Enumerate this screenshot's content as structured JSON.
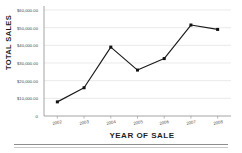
{
  "chart_data": {
    "type": "line",
    "title": "",
    "xlabel": "YEAR OF SALE",
    "ylabel": "TOTAL SALES",
    "categories": [
      "2002",
      "2003",
      "2004",
      "2005",
      "2006",
      "2007",
      "2008"
    ],
    "values": [
      8000,
      16000,
      39000,
      26000,
      32500,
      51500,
      49000
    ],
    "series": [
      {
        "name": "Total Sales",
        "values": [
          8000,
          16000,
          39000,
          26000,
          32500,
          51500,
          49000
        ]
      }
    ],
    "ylim": [
      0,
      60000
    ],
    "ytick_labels": [
      "$60,000.00",
      "$50,000.00",
      "$40,000.00",
      "$30,000.00",
      "$20,000.00",
      "$10,000.00"
    ],
    "ytick_values": [
      60000,
      50000,
      40000,
      30000,
      20000,
      10000
    ],
    "origin_label": "0",
    "grid": "horizontal",
    "legend": "none",
    "marker": "square",
    "line_color": "#1a1a1a",
    "marker_color": "#111111",
    "grid_color": "#dcdcdc",
    "axis_color": "#9a9a9a"
  }
}
